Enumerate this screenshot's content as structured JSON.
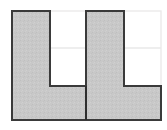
{
  "figure": {
    "canvas": {
      "width": 167,
      "height": 130,
      "background": "#ffffff"
    },
    "colors": {
      "fill": "#c8c8c8",
      "fill_texture": "#bdbdbd",
      "outline": "#3a3a3a",
      "outline_dark": "#2e2e2e",
      "grid_line": "#e9e9e9",
      "grid_border": "#eceaea",
      "background": "#ffffff"
    },
    "stroke_width": 2,
    "grid": {
      "visible": true,
      "left": 12,
      "top": 11,
      "right": 161,
      "bottom": 120,
      "columns_x": [
        12,
        50,
        86,
        124,
        161
      ],
      "rows_y": [
        11,
        48,
        86,
        120
      ],
      "cell_width": 37,
      "cell_height": 37
    },
    "shapes": [
      {
        "name": "left-l-shape",
        "label": "L",
        "orientation": "upright",
        "points": "12,11 50,11 50,86 86,86 86,120 12,120",
        "cells": 4
      },
      {
        "name": "right-l-shape",
        "label": "L",
        "orientation": "upright",
        "points": "86,11 124,11 124,86 161,86 161,120 86,120",
        "cells": 4
      }
    ],
    "divider": {
      "name": "center-divider",
      "x": 86,
      "y1": 86,
      "y2": 120
    }
  }
}
